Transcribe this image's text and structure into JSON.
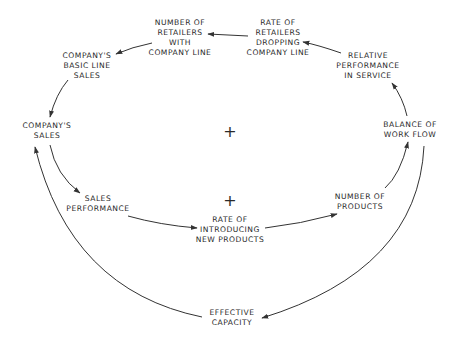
{
  "diagram": {
    "type": "causal-loop",
    "nodes": [
      {
        "id": "retailers_with_line",
        "lines": [
          "NUMBER OF",
          "RETAILERS",
          "WITH",
          "COMPANY LINE"
        ]
      },
      {
        "id": "rate_dropping",
        "lines": [
          "RATE OF",
          "RETAILERS",
          "DROPPING",
          "COMPANY LINE"
        ]
      },
      {
        "id": "basic_line_sales",
        "lines": [
          "COMPANY'S",
          "BASIC LINE",
          "SALES"
        ]
      },
      {
        "id": "relative_performance",
        "lines": [
          "RELATIVE",
          "PERFORMANCE",
          "IN SERVICE"
        ]
      },
      {
        "id": "company_sales",
        "lines": [
          "COMPANY'S",
          "SALES"
        ]
      },
      {
        "id": "balance_work_flow",
        "lines": [
          "BALANCE OF",
          "WORK FLOW"
        ]
      },
      {
        "id": "sales_performance",
        "lines": [
          "SALES",
          "PERFORMANCE"
        ]
      },
      {
        "id": "number_of_products",
        "lines": [
          "NUMBER OF",
          "PRODUCTS"
        ]
      },
      {
        "id": "rate_new_products",
        "lines": [
          "RATE OF",
          "INTRODUCING",
          "NEW PRODUCTS"
        ]
      },
      {
        "id": "effective_capacity",
        "lines": [
          "EFFECTIVE",
          "CAPACITY"
        ]
      }
    ],
    "loop_polarities": [
      {
        "id": "outer_loop",
        "symbol": "+"
      },
      {
        "id": "inner_loop",
        "symbol": "+"
      }
    ],
    "edges": [
      {
        "from": "rate_dropping",
        "to": "retailers_with_line"
      },
      {
        "from": "retailers_with_line",
        "to": "basic_line_sales"
      },
      {
        "from": "basic_line_sales",
        "to": "company_sales"
      },
      {
        "from": "company_sales",
        "to": "sales_performance"
      },
      {
        "from": "sales_performance",
        "to": "rate_new_products"
      },
      {
        "from": "rate_new_products",
        "to": "number_of_products"
      },
      {
        "from": "number_of_products",
        "to": "balance_work_flow"
      },
      {
        "from": "balance_work_flow",
        "to": "relative_performance"
      },
      {
        "from": "relative_performance",
        "to": "rate_dropping"
      },
      {
        "from": "balance_work_flow",
        "to": "effective_capacity"
      },
      {
        "from": "effective_capacity",
        "to": "company_sales"
      }
    ],
    "colors": {
      "ink": "#2a2a2a",
      "background": "#ffffff"
    }
  }
}
